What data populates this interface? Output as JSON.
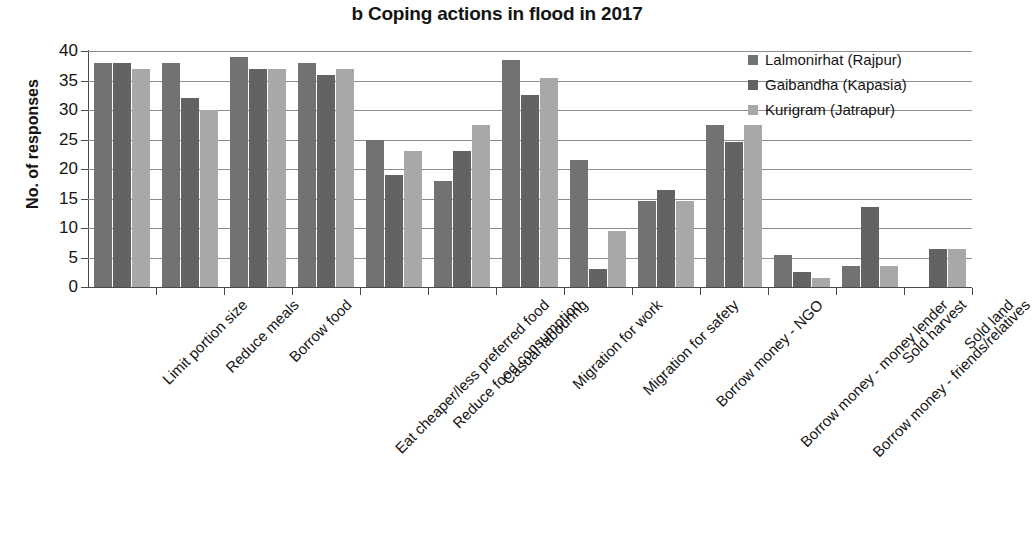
{
  "chart_data": {
    "type": "bar",
    "title": "b Coping actions in flood in 2017",
    "xlabel": "",
    "ylabel": "No. of responses",
    "ylim": [
      0,
      40
    ],
    "ytick_step": 5,
    "yticks": [
      40,
      35,
      30,
      25,
      20,
      15,
      10,
      5,
      0
    ],
    "grid": true,
    "legend_position": "top-right",
    "categories": [
      "Limit portion size",
      "Reduce meals",
      "Borrow food",
      "Eat cheaper/less preferred food",
      "Reduce food consumption",
      "Casual labouring",
      "Migration for work",
      "Migration for safety",
      "Borrow money - NGO",
      "Borrow money - money lender",
      "Borrow money - friends/relatives",
      "Sold harvest",
      "Sold land"
    ],
    "series": [
      {
        "name": "Lalmonirhat (Rajpur)",
        "color": "#727272",
        "values": [
          38,
          38,
          39,
          38,
          25,
          18,
          38.5,
          21.5,
          14.5,
          27.5,
          5.5,
          3.5,
          0
        ]
      },
      {
        "name": "Gaibandha (Kapasia)",
        "color": "#636363",
        "values": [
          38,
          32,
          37,
          36,
          19,
          23,
          32.5,
          3,
          16.5,
          24.5,
          2.5,
          13.5,
          6.5
        ]
      },
      {
        "name": "Kurigram (Jatrapur)",
        "color": "#a8a8a8",
        "values": [
          37,
          30,
          37,
          37,
          23,
          27.5,
          35.5,
          9.5,
          14.5,
          27.5,
          1.5,
          3.5,
          6.5
        ]
      }
    ]
  },
  "legend": {
    "items": [
      "Lalmonirhat (Rajpur)",
      "Gaibandha (Kapasia)",
      "Kurigram (Jatrapur)"
    ]
  }
}
